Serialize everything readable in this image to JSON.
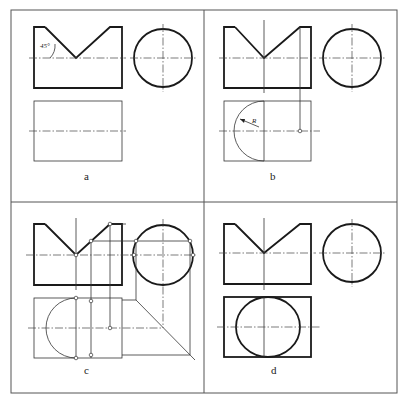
{
  "figure": {
    "panels": [
      {
        "id": "a",
        "label": "a",
        "annotation": "45°"
      },
      {
        "id": "b",
        "label": "b",
        "annotation": "R"
      },
      {
        "id": "c",
        "label": "c"
      },
      {
        "id": "d",
        "label": "d"
      }
    ],
    "colors": {
      "line": "#1a1a1a",
      "frame": "#555555",
      "background": "#ffffff"
    }
  }
}
